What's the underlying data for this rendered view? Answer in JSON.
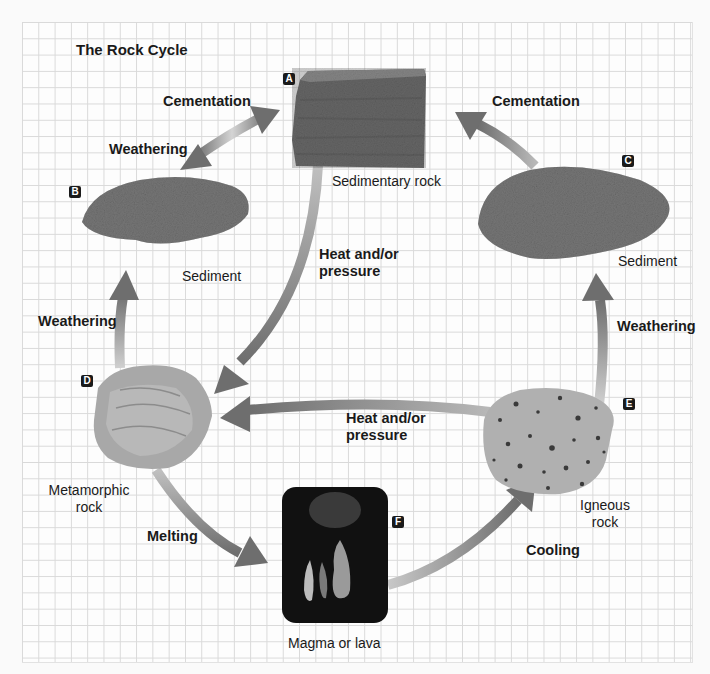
{
  "diagram": {
    "title": "The Rock Cycle",
    "colors": {
      "arrow": "#6e6e6e",
      "arrow_fade": "#c8c8c8",
      "grid_line": "#d9d9d9",
      "badge": "#1a1a1a",
      "background": "#fdfdfd"
    },
    "nodes": [
      {
        "id": "A",
        "label": "Sedimentary rock"
      },
      {
        "id": "B",
        "label": "Sediment"
      },
      {
        "id": "C",
        "label": "Sediment"
      },
      {
        "id": "D",
        "label_line1": "Metamorphic",
        "label_line2": "rock"
      },
      {
        "id": "E",
        "label_line1": "Igneous",
        "label_line2": "rock"
      },
      {
        "id": "F",
        "label": "Magma or lava"
      }
    ],
    "processes": {
      "cementation_left": "Cementation",
      "weathering_top_left": "Weathering",
      "cementation_right": "Cementation",
      "heat_pressure_center_line1": "Heat and/or",
      "heat_pressure_center_line2": "pressure",
      "weathering_left": "Weathering",
      "weathering_right": "Weathering",
      "heat_pressure_lower_line1": "Heat and/or",
      "heat_pressure_lower_line2": "pressure",
      "melting": "Melting",
      "cooling": "Cooling"
    },
    "arrows": [
      {
        "from": "B",
        "to": "A",
        "process": "Cementation",
        "bidirectional": true
      },
      {
        "from": "A",
        "to": "B",
        "process": "Weathering",
        "bidirectional": true
      },
      {
        "from": "C",
        "to": "A",
        "process": "Cementation"
      },
      {
        "from": "A",
        "to": "D",
        "process": "Heat and/or pressure"
      },
      {
        "from": "D",
        "to": "B",
        "process": "Weathering"
      },
      {
        "from": "E",
        "to": "C",
        "process": "Weathering"
      },
      {
        "from": "E",
        "to": "D",
        "process": "Heat and/or pressure"
      },
      {
        "from": "D",
        "to": "F",
        "process": "Melting"
      },
      {
        "from": "F",
        "to": "E",
        "process": "Cooling"
      }
    ]
  }
}
